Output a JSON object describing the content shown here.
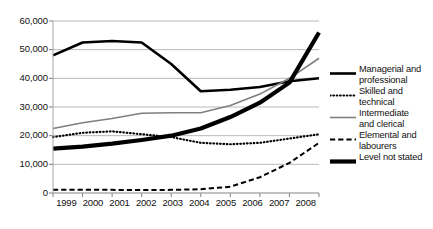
{
  "chart_data": {
    "type": "line",
    "title": "",
    "xlabel": "",
    "ylabel": "",
    "x": [
      1999,
      2000,
      2001,
      2002,
      2003,
      2004,
      2005,
      2006,
      2007,
      2008
    ],
    "categories": [
      "1999",
      "2000",
      "2001",
      "2002",
      "2003",
      "2004",
      "2005",
      "2006",
      "2007",
      "2008"
    ],
    "ylim": [
      0,
      60000
    ],
    "ytick_values": [
      60000,
      50000,
      40000,
      30000,
      20000,
      10000,
      0
    ],
    "ytick_labels": [
      "60,000",
      "50,000",
      "40,000",
      "30,000",
      "20,000",
      "10,000",
      "0"
    ],
    "grid": "horizontal",
    "legend_position": "right",
    "series": [
      {
        "name": "Managerial and professional",
        "label": "Managerial and\nprofessional",
        "style": "solid",
        "color": "#000000",
        "width": 2.6,
        "values": [
          48000,
          52500,
          53000,
          52500,
          45000,
          35500,
          36000,
          37000,
          39000,
          40000
        ]
      },
      {
        "name": "Skilled and technical",
        "label": "Skilled and\ntechnical",
        "style": "dotted",
        "color": "#000000",
        "width": 2.2,
        "values": [
          19500,
          21000,
          21500,
          20500,
          19500,
          17500,
          17000,
          17500,
          19000,
          20500
        ]
      },
      {
        "name": "Intermediate and clerical",
        "label": "Intermediate\nand clerical",
        "style": "solid",
        "color": "#7f7f7f",
        "width": 1.6,
        "values": [
          22500,
          24500,
          26000,
          27800,
          28000,
          28000,
          30500,
          34500,
          40000,
          47000
        ]
      },
      {
        "name": "Elemental and labourers",
        "label": "Elemental and\nlabourers",
        "style": "dashed",
        "color": "#000000",
        "width": 2.0,
        "values": [
          1100,
          1100,
          1100,
          1000,
          1100,
          1300,
          2200,
          5500,
          10500,
          17500
        ]
      },
      {
        "name": "Level not stated",
        "label": "Level not stated",
        "style": "solid",
        "color": "#000000",
        "width": 4.2,
        "values": [
          15500,
          16200,
          17200,
          18500,
          20000,
          22500,
          26500,
          31500,
          38500,
          56000
        ]
      }
    ]
  },
  "axes": {
    "y_labels": [
      "60,000",
      "50,000",
      "40,000",
      "30,000",
      "20,000",
      "10,000",
      "0"
    ],
    "x_labels": [
      "1999",
      "2000",
      "2001",
      "2002",
      "2003",
      "2004",
      "2005",
      "2006",
      "2007",
      "2008"
    ]
  },
  "legend": {
    "items": [
      {
        "label": "Managerial and\nprofessional",
        "style": "solid",
        "color": "#000000",
        "width": 2.6
      },
      {
        "label": "Skilled and\ntechnical",
        "style": "dotted",
        "color": "#000000",
        "width": 2.2
      },
      {
        "label": "Intermediate\nand clerical",
        "style": "solid",
        "color": "#7f7f7f",
        "width": 1.6
      },
      {
        "label": "Elemental and\nlabourers",
        "style": "dashed",
        "color": "#000000",
        "width": 2.0
      },
      {
        "label": "Level not stated",
        "style": "solid",
        "color": "#000000",
        "width": 4.2
      }
    ]
  },
  "colors": {
    "background": "#ffffff",
    "grid": "#a6a6a6",
    "axis": "#7f7f7f",
    "text": "#111111",
    "series_black": "#000000",
    "series_gray": "#7f7f7f"
  }
}
